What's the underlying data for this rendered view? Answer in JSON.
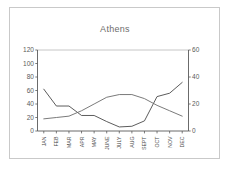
{
  "chart_data": {
    "type": "line",
    "title": "Athens",
    "xlabel": "",
    "ylabel": "",
    "categories": [
      "JAN",
      "FEB",
      "MAR",
      "APR",
      "MAY",
      "JUNE",
      "JULY",
      "AUG",
      "SEPT",
      "OCT",
      "NOV",
      "DEC"
    ],
    "grid": false,
    "legend": "none",
    "axes": {
      "left": {
        "ticks": [
          "0",
          "20",
          "40",
          "60",
          "80",
          "100",
          "120"
        ],
        "values": [
          0,
          20,
          40,
          60,
          80,
          100,
          120
        ],
        "ylim": [
          0,
          120
        ]
      },
      "right": {
        "ticks": [
          "0",
          "20",
          "40",
          "60"
        ],
        "values": [
          0,
          20,
          40,
          60
        ],
        "ylim": [
          0,
          60
        ]
      }
    },
    "series": [
      {
        "name": "precipitation",
        "axis": "left",
        "color": "#4a4a4a",
        "values": [
          62,
          37,
          37,
          23,
          23,
          14,
          6,
          7,
          15,
          51,
          56,
          72
        ]
      },
      {
        "name": "temperature",
        "axis": "right",
        "color": "#6b6b6b",
        "values": [
          9,
          10,
          11,
          15,
          20,
          25,
          27,
          27,
          24,
          19,
          15,
          11
        ]
      }
    ]
  },
  "frame": {
    "border_color": "#c9c9c9",
    "background": "#ffffff"
  }
}
